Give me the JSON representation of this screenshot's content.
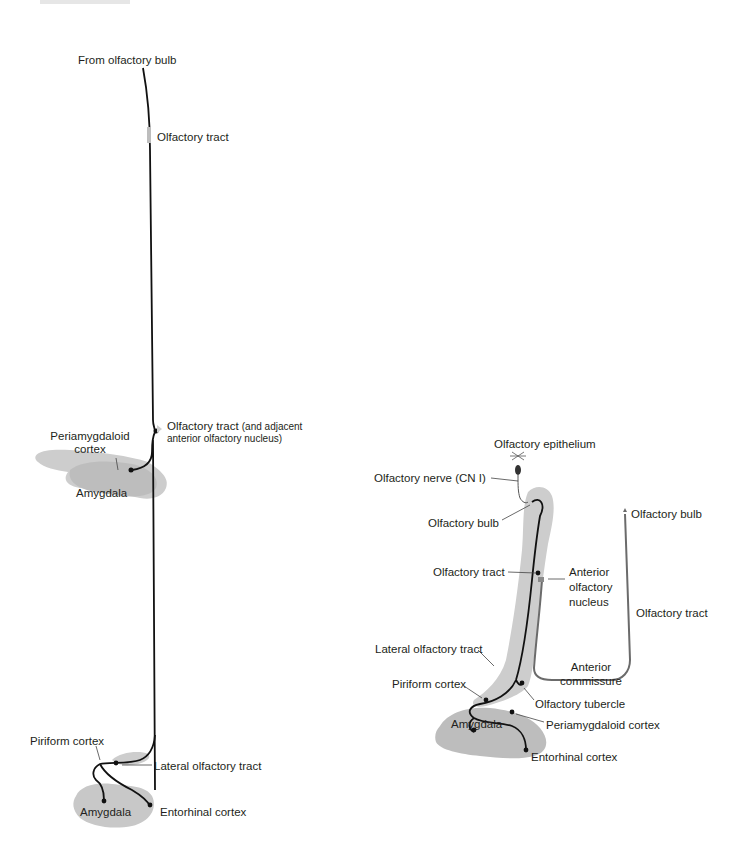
{
  "figure": {
    "type": "neuroanatomy-diagram",
    "colors": {
      "region_fill": "#c8c8c8",
      "region_fill_light": "#d9d9d9",
      "pathway_black": "#111111",
      "pathway_gray": "#6b6b6b",
      "leader_line": "#444444",
      "text": "#231f20"
    }
  },
  "left_panel": {
    "labels": {
      "from_olfactory_bulb": "From olfactory bulb",
      "olfactory_tract": "Olfactory tract",
      "olfactory_tract_aon_main": "Olfactory tract",
      "olfactory_tract_aon_sub1": "(and adjacent",
      "olfactory_tract_aon_sub2": "anterior olfactory nucleus)",
      "periamygdaloid_line1": "Periamygdaloid",
      "periamygdaloid_line2": "cortex",
      "amygdala_upper": "Amygdala",
      "piriform_cortex": "Piriform cortex",
      "lateral_olfactory_tract": "Lateral olfactory tract",
      "amygdala_lower": "Amygdala",
      "entorhinal_cortex": "Entorhinal cortex"
    }
  },
  "right_panel": {
    "labels": {
      "olfactory_epithelium": "Olfactory epithelium",
      "olfactory_nerve": "Olfactory nerve (CN I)",
      "olfactory_bulb_left": "Olfactory bulb",
      "olfactory_bulb_right": "Olfactory bulb",
      "olfactory_tract_left": "Olfactory tract",
      "anterior_olfactory_nucleus_1": "Anterior",
      "anterior_olfactory_nucleus_2": "olfactory",
      "anterior_olfactory_nucleus_3": "nucleus",
      "olfactory_tract_right": "Olfactory tract",
      "lateral_olfactory_tract": "Lateral olfactory tract",
      "anterior_commissure_1": "Anterior",
      "anterior_commissure_2": "commissure",
      "piriform_cortex": "Piriform cortex",
      "olfactory_tubercle": "Olfactory tubercle",
      "amygdala": "Amygdala",
      "periamygdaloid_cortex": "Periamygdaloid cortex",
      "entorhinal_cortex": "Entorhinal cortex"
    }
  }
}
